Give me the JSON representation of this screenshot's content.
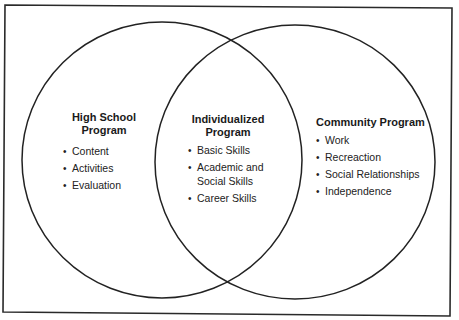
{
  "diagram": {
    "type": "venn",
    "frame": {
      "stroke": "#2a2a2a"
    },
    "circles": [
      {
        "id": "high-school",
        "cx": 162,
        "cy": 160,
        "rx": 140,
        "ry": 138
      },
      {
        "id": "community",
        "cx": 295,
        "cy": 162,
        "rx": 140,
        "ry": 137
      }
    ],
    "stroke_color": "#222222",
    "bullet_glyph": "•",
    "regions": {
      "left": {
        "title_line1": "High School",
        "title_line2": "Program",
        "items": [
          "Content",
          "Activities",
          "Evaluation"
        ]
      },
      "center": {
        "title_line1": "Individualized",
        "title_line2": "Program",
        "items": [
          "Basic Skills",
          "Academic and",
          "Social Skills",
          "Career Skills"
        ]
      },
      "right": {
        "title_line1": "Community Program",
        "items": [
          "Work",
          "Recreaction",
          "Social Relationships",
          "Independence"
        ]
      }
    }
  }
}
